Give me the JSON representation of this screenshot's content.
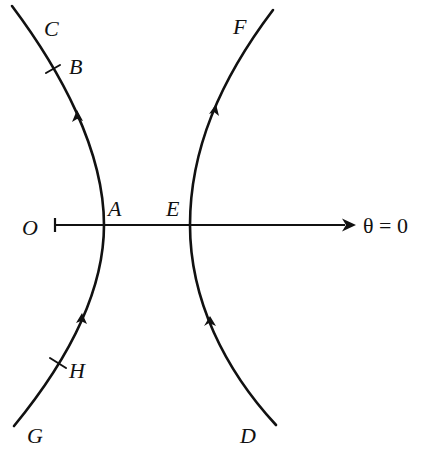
{
  "diagram": {
    "colors": {
      "ink": "#111111",
      "background": "#ffffff"
    },
    "axis": {
      "origin_label": "O",
      "direction_label": "θ = 0"
    },
    "left_branch": {
      "top_label": "C",
      "upper_point_label": "B",
      "vertex_label": "A",
      "lower_point_label": "H",
      "bottom_label": "G",
      "direction": "upward (G → H → A → B → C)"
    },
    "right_branch": {
      "top_label": "F",
      "vertex_label": "E",
      "bottom_label": "D",
      "direction": "upward (D → E → F)"
    }
  }
}
